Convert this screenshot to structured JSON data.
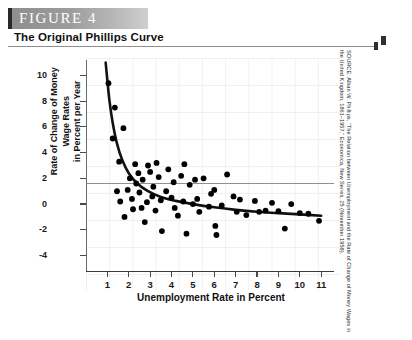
{
  "figure": {
    "banner_label": "FIGURE  4",
    "title": "The Original Phillips Curve",
    "banner_color": "#9d9d9d",
    "accent_color": "#2a2a2a"
  },
  "source": {
    "text": "SOURCE: Alban W. Phillips, “The Relation between Unemployment and the Rate of Change of Money Wages in the United Kingdom, 1861–1957,” Economica, New Series, 25 (November 1958)."
  },
  "chart_data": {
    "type": "scatter",
    "title": "The Original Phillips Curve",
    "xlabel": "Unemployment Rate in Percent",
    "ylabel": "Rate of Change of Money Wage Rates\nin Percent per Year",
    "xlim": [
      0,
      11.6
    ],
    "ylim": [
      -5.2,
      11.2
    ],
    "xticks": [
      1,
      2,
      3,
      4,
      5,
      6,
      7,
      8,
      9,
      10,
      11
    ],
    "xtick_labels": [
      "1",
      "2",
      "3",
      "4",
      "5",
      "6",
      "7",
      "8",
      "9",
      "10",
      "11"
    ],
    "yticks": [
      10,
      8,
      6,
      4,
      2,
      0,
      -2,
      -4
    ],
    "ytick_labels": [
      "10",
      "8",
      "6",
      "4",
      "2",
      "0",
      "-2",
      "-4"
    ],
    "grid": true,
    "zero_line": true,
    "legend": "none",
    "marker_color": "#000000",
    "curve_color": "#111111",
    "points": [
      [
        1.05,
        9.4
      ],
      [
        1.35,
        7.5
      ],
      [
        1.25,
        5.1
      ],
      [
        1.75,
        5.9
      ],
      [
        1.55,
        3.3
      ],
      [
        1.95,
        1.1
      ],
      [
        2.05,
        2.0
      ],
      [
        2.15,
        0.4
      ],
      [
        2.2,
        -0.4
      ],
      [
        2.35,
        1.6
      ],
      [
        1.6,
        0.2
      ],
      [
        1.8,
        -1.0
      ],
      [
        2.45,
        2.4
      ],
      [
        2.5,
        0.9
      ],
      [
        2.6,
        -0.3
      ],
      [
        2.65,
        1.9
      ],
      [
        2.75,
        -1.4
      ],
      [
        2.9,
        3.0
      ],
      [
        3.0,
        2.5
      ],
      [
        3.1,
        0.6
      ],
      [
        3.15,
        1.35
      ],
      [
        3.25,
        -0.5
      ],
      [
        3.4,
        2.1
      ],
      [
        3.5,
        0.3
      ],
      [
        3.55,
        -2.1
      ],
      [
        3.75,
        1.0
      ],
      [
        3.85,
        2.7
      ],
      [
        4.0,
        0.5
      ],
      [
        4.1,
        1.7
      ],
      [
        4.15,
        -0.3
      ],
      [
        4.3,
        -0.9
      ],
      [
        4.45,
        2.2
      ],
      [
        4.55,
        0.2
      ],
      [
        4.7,
        -2.3
      ],
      [
        4.85,
        1.5
      ],
      [
        5.0,
        0.0
      ],
      [
        5.1,
        1.9
      ],
      [
        5.3,
        -0.6
      ],
      [
        5.5,
        2.0
      ],
      [
        5.75,
        -0.2
      ],
      [
        5.85,
        0.8
      ],
      [
        6.0,
        1.1
      ],
      [
        6.05,
        -1.7
      ],
      [
        6.1,
        -2.4
      ],
      [
        6.35,
        -0.1
      ],
      [
        6.6,
        2.3
      ],
      [
        6.9,
        0.6
      ],
      [
        7.05,
        -0.6
      ],
      [
        7.2,
        0.35
      ],
      [
        7.5,
        -0.85
      ],
      [
        7.9,
        0.25
      ],
      [
        8.1,
        -0.6
      ],
      [
        8.4,
        -0.5
      ],
      [
        8.7,
        0.1
      ],
      [
        9.0,
        -0.55
      ],
      [
        9.3,
        -1.9
      ],
      [
        9.6,
        0.0
      ],
      [
        10.0,
        -0.7
      ],
      [
        10.4,
        -0.75
      ],
      [
        10.9,
        -1.3
      ],
      [
        2.3,
        3.1
      ],
      [
        4.6,
        3.1
      ],
      [
        3.3,
        3.2
      ],
      [
        5.2,
        0.4
      ],
      [
        1.45,
        1.0
      ],
      [
        2.85,
        0.15
      ]
    ],
    "fitted_curve": {
      "description": "Downward sloping convex Phillips curve",
      "points": [
        [
          0.92,
          11.0
        ],
        [
          1.0,
          9.6
        ],
        [
          1.1,
          8.0
        ],
        [
          1.25,
          6.3
        ],
        [
          1.45,
          4.7
        ],
        [
          1.7,
          3.4
        ],
        [
          2.0,
          2.4
        ],
        [
          2.4,
          1.6
        ],
        [
          2.9,
          1.0
        ],
        [
          3.5,
          0.55
        ],
        [
          4.2,
          0.25
        ],
        [
          5.0,
          0.0
        ],
        [
          6.0,
          -0.25
        ],
        [
          7.0,
          -0.45
        ],
        [
          8.0,
          -0.6
        ],
        [
          9.0,
          -0.7
        ],
        [
          10.0,
          -0.8
        ],
        [
          11.0,
          -0.9
        ]
      ]
    }
  }
}
